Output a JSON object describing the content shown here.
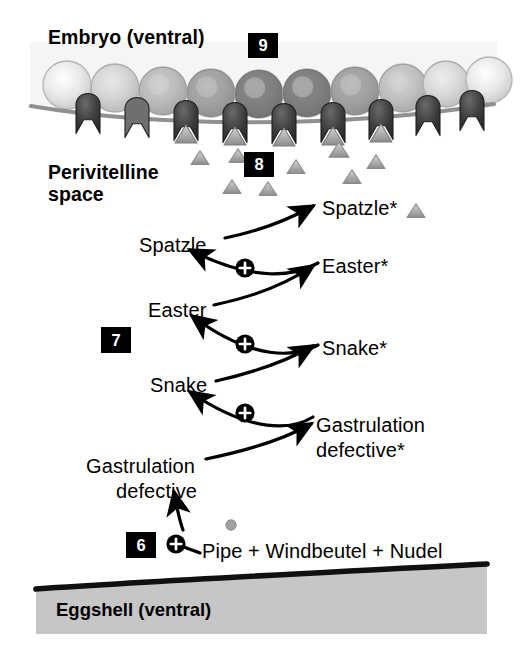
{
  "figure": {
    "type": "diagram"
  },
  "labels": {
    "embryo": "Embryo (ventral)",
    "perivitelline_line1": "Perivitelline",
    "perivitelline_line2": "space",
    "eggshell": "Eggshell (ventral)"
  },
  "badges": [
    {
      "id": "step-9",
      "text": "9",
      "x": 248,
      "y": 33,
      "w": 30,
      "h": 25
    },
    {
      "id": "step-8",
      "text": "8",
      "x": 244,
      "y": 152,
      "w": 30,
      "h": 25
    },
    {
      "id": "step-7",
      "text": "7",
      "x": 101,
      "y": 327,
      "w": 30,
      "h": 26
    },
    {
      "id": "step-6",
      "text": "6",
      "x": 126,
      "y": 532,
      "w": 30,
      "h": 26
    }
  ],
  "cascade": {
    "steps": [
      {
        "id": "spatzle-active",
        "text": "Spatzle*",
        "x": 322,
        "y": 197,
        "align": "left"
      },
      {
        "id": "spatzle",
        "text": "Spatzle",
        "x": 139,
        "y": 234,
        "align": "left"
      },
      {
        "id": "easter-active",
        "text": "Easter*",
        "x": 322,
        "y": 255,
        "align": "left"
      },
      {
        "id": "easter",
        "text": "Easter",
        "x": 148,
        "y": 299,
        "align": "left"
      },
      {
        "id": "snake-active",
        "text": "Snake*",
        "x": 322,
        "y": 337,
        "align": "left"
      },
      {
        "id": "snake",
        "text": "Snake",
        "x": 150,
        "y": 374,
        "align": "left"
      },
      {
        "id": "gd-active-l1",
        "text": "Gastrulation",
        "x": 316,
        "y": 414,
        "align": "left"
      },
      {
        "id": "gd-active-l2",
        "text": "defective*",
        "x": 316,
        "y": 439,
        "align": "left"
      },
      {
        "id": "gd-l1",
        "text": "Gastrulation",
        "x": 86,
        "y": 455,
        "align": "left"
      },
      {
        "id": "gd-l2",
        "text": "defective",
        "x": 116,
        "y": 480,
        "align": "left"
      },
      {
        "id": "pipe-line",
        "text": "Pipe + Windbeutel + Nudel",
        "x": 202,
        "y": 540,
        "align": "left"
      }
    ],
    "activator_symbol": "+",
    "activators": [
      {
        "id": "plus-easter-to-spatzle",
        "cx": 245,
        "cy": 268
      },
      {
        "id": "plus-snake-to-easter",
        "cx": 245,
        "cy": 344
      },
      {
        "id": "plus-gd-to-snake",
        "cx": 245,
        "cy": 413
      },
      {
        "id": "plus-pipe-to-gd",
        "cx": 176,
        "cy": 544
      }
    ]
  },
  "colors": {
    "ink": "#000000",
    "membrane": "#8f8f8f",
    "eggshell_fill": "#c6c6c6",
    "eggshell_edge": "#111111",
    "ligand_fill": "#9a9a9a",
    "ligand_edge": "#6e6e6e",
    "receptor_dark": "#3b3b3b",
    "receptor_light": "#7a7a7a",
    "embryo_cytoplasm": "#f4f4f4",
    "pipe_dot": "#9a9a9a"
  },
  "embryo": {
    "cell_count": 10,
    "cells": [
      {
        "cx": 67,
        "cy": 85,
        "r": 24,
        "shade": 0.0
      },
      {
        "cx": 115,
        "cy": 88,
        "r": 24,
        "shade": 0.18
      },
      {
        "cx": 163,
        "cy": 91,
        "r": 24,
        "shade": 0.4
      },
      {
        "cx": 211,
        "cy": 93,
        "r": 24,
        "shade": 0.62
      },
      {
        "cx": 259,
        "cy": 94,
        "r": 24,
        "shade": 0.92
      },
      {
        "cx": 307,
        "cy": 93,
        "r": 24,
        "shade": 0.92
      },
      {
        "cx": 355,
        "cy": 91,
        "r": 24,
        "shade": 0.62
      },
      {
        "cx": 403,
        "cy": 88,
        "r": 24,
        "shade": 0.35
      },
      {
        "cx": 446,
        "cy": 84,
        "r": 23,
        "shade": 0.14
      },
      {
        "cx": 489,
        "cy": 80,
        "r": 23,
        "shade": 0.0
      }
    ],
    "receptors": [
      {
        "cx": 88,
        "cy": 118,
        "dark": true,
        "bound": false
      },
      {
        "cx": 137,
        "cy": 122,
        "dark": false,
        "bound": false
      },
      {
        "cx": 186,
        "cy": 125,
        "dark": true,
        "bound": true
      },
      {
        "cx": 235,
        "cy": 127,
        "dark": true,
        "bound": true
      },
      {
        "cx": 284,
        "cy": 128,
        "dark": true,
        "bound": true
      },
      {
        "cx": 333,
        "cy": 127,
        "dark": true,
        "bound": true
      },
      {
        "cx": 381,
        "cy": 124,
        "dark": true,
        "bound": true
      },
      {
        "cx": 428,
        "cy": 120,
        "dark": true,
        "bound": false
      },
      {
        "cx": 472,
        "cy": 115,
        "dark": true,
        "bound": false
      }
    ],
    "free_ligands": [
      {
        "cx": 200,
        "cy": 158,
        "s": 9
      },
      {
        "cx": 238,
        "cy": 156,
        "s": 9
      },
      {
        "cx": 296,
        "cy": 167,
        "s": 9
      },
      {
        "cx": 339,
        "cy": 150,
        "s": 10
      },
      {
        "cx": 376,
        "cy": 162,
        "s": 9
      },
      {
        "cx": 352,
        "cy": 177,
        "s": 9
      },
      {
        "cx": 232,
        "cy": 187,
        "s": 9
      },
      {
        "cx": 268,
        "cy": 189,
        "s": 9
      },
      {
        "cx": 416,
        "cy": 211,
        "s": 9
      }
    ]
  }
}
